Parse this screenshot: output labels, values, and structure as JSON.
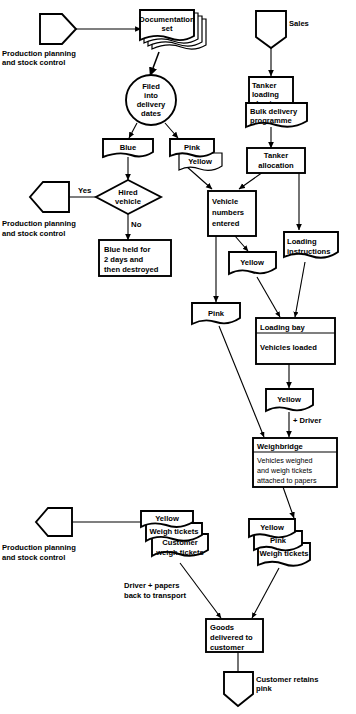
{
  "diagram": {
    "nodes": {
      "prod_plan_top": "Production planning\nand stock control",
      "documentation_set": "Documentation\nset",
      "filed": "Filed\ninto\ndelivery\ndates",
      "blue": "Blue",
      "pink_top": "Pink",
      "yellow_top": "Yellow",
      "hired_vehicle": "Hired\nvehicle",
      "prod_plan_mid": "Production planning\nand stock control",
      "blue_held": "Blue held for\n2 days and\nthen destroyed",
      "sales": "Sales",
      "tanker_loading_sheet": "Tanker\nloading\nsheet",
      "bulk_delivery": "Bulk delivery\nprogramme",
      "tanker_allocation": "Tanker\nallocation",
      "vehicle_numbers": "Vehicle\nnumbers\nentered",
      "yellow_mid": "Yellow",
      "loading_instructions": "Loading\ninstructions",
      "pink_mid": "Pink",
      "loading_bay_header": "Loading bay",
      "loading_bay_body": "Vehicles loaded",
      "yellow_driver": "Yellow",
      "weighbridge_header": "Weighbridge",
      "weighbridge_body": "Vehicles weighed\nand weigh tickets\nattached to papers",
      "yellow_left": "Yellow",
      "weigh_tickets_left": "Weigh tickets",
      "customer_weigh_tickets": "Customer\nweigh tickets",
      "prod_plan_bottom": "Production planning\nand stock control",
      "yellow_right": "Yellow",
      "pink_right": "Pink",
      "weigh_tickets_right": "Weigh tickets",
      "goods_delivered": "Goods\ndelivered to\ncustomer",
      "customer_retains": "Customer retains\npink"
    },
    "edge_labels": {
      "yes": "Yes",
      "no": "No",
      "plus_driver": "+ Driver",
      "driver_papers": "Driver + papers\nback to transport"
    },
    "colors": {
      "stroke": "#000000",
      "fill": "#ffffff",
      "background": "#ffffff"
    }
  }
}
